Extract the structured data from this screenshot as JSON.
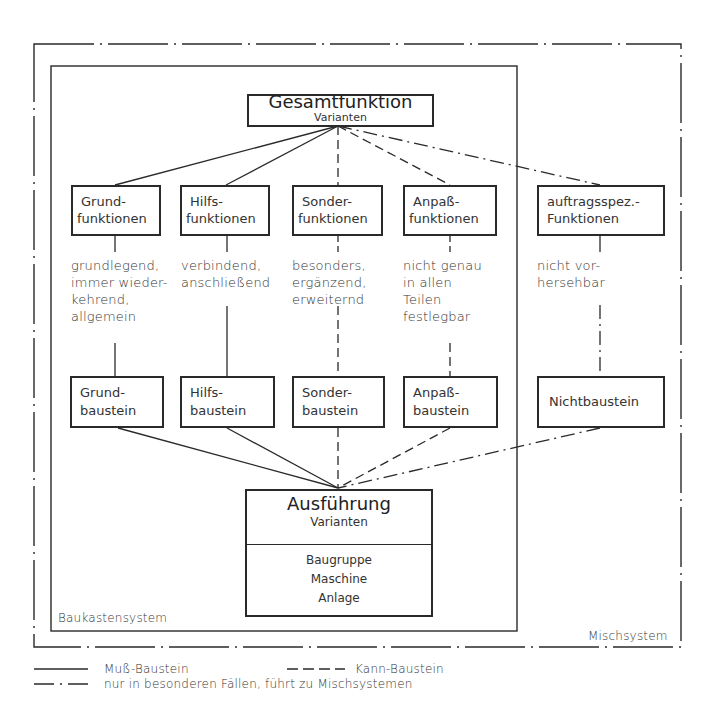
{
  "diagram": {
    "title_box": {
      "title": "Gesamtfunktion",
      "subtitle": "Varianten"
    },
    "function_boxes": [
      {
        "line1": "Grund-",
        "line2": "funktionen",
        "description": [
          "grundlegend,",
          "immer wieder-",
          "kehrend,",
          "allgemein"
        ],
        "link_type": "solid"
      },
      {
        "line1": "Hilfs-",
        "line2": "funktionen",
        "description": [
          "verbindend,",
          "anschließend"
        ],
        "link_type": "solid"
      },
      {
        "line1": "Sonder-",
        "line2": "funktionen",
        "description": [
          "besonders,",
          "ergänzend,",
          "erweiternd"
        ],
        "link_type": "dashed"
      },
      {
        "line1": "Anpaß-",
        "line2": "funktionen",
        "description": [
          "nicht genau",
          "in allen",
          "Teilen",
          "festlegbar"
        ],
        "link_type": "dashed"
      },
      {
        "line1": "auftragsspez.-",
        "line2": "Funktionen",
        "description": [
          "nicht vor-",
          "hersehbar"
        ],
        "link_type": "dash-dot"
      }
    ],
    "building_blocks": [
      {
        "line1": "Grund-",
        "line2": "baustein"
      },
      {
        "line1": "Hilfs-",
        "line2": "baustein"
      },
      {
        "line1": "Sonder-",
        "line2": "baustein"
      },
      {
        "line1": "Anpaß-",
        "line2": "baustein"
      },
      {
        "line1": "Nichtbaustein",
        "line2": ""
      }
    ],
    "result_box": {
      "title": "Ausführung",
      "subtitle": "Varianten",
      "items": [
        "Baugruppe",
        "Maschine",
        "Anlage"
      ]
    },
    "inner_system_label": "Baukastensystem",
    "outer_system_label": "Mischsystem"
  },
  "legend": {
    "solid": "Muß-Baustein",
    "dashed": "Kann-Baustein",
    "dash_dot": "nur in besonderen Fällen, führt zu Mischsystemen"
  },
  "colors": {
    "line": "#2a2a2a",
    "background": "#ffffff"
  }
}
